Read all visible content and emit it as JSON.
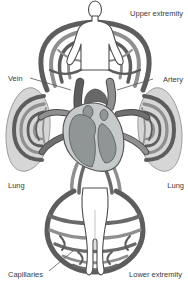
{
  "diagram": {
    "labels": {
      "upper_extremity": "Upper extremity",
      "vein": "Vein",
      "artery": "Artery",
      "lung_left": "Lung",
      "lung_right": "Lung",
      "capillaries": "Capillaries",
      "lower_extremity": "Lower extremity"
    },
    "colors": {
      "vessel_dark": "#5d5d5d",
      "vessel_medium_dark": "#6a6a6a",
      "vessel_mid": "#8f8f8f",
      "lung_fill": "#d6d6d6",
      "lung_outline": "#9b9b9b",
      "heart_wall": "#c6caca",
      "heart_chamber": "#909696",
      "aorta": "#686868",
      "figure_fill": "#ffffff",
      "figure_outline": "#4d4d4d",
      "label_text": "#3a3a3a",
      "background": "#ffffff"
    }
  }
}
